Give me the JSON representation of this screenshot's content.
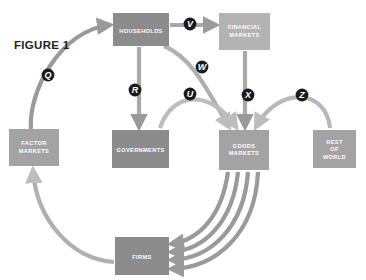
{
  "figure": {
    "title": "FIGURE 1",
    "background": "#ffffff"
  },
  "colors": {
    "box_dark": "#8c8c8c",
    "box_light": "#b3b3b3",
    "box_mid": "#a3a3a3",
    "flow_dark": "#9a9a9a",
    "flow_light": "#bdbdbd",
    "node_circle": "#1a1a1a",
    "title_text": "#231f20",
    "label_text": "#ffffff"
  },
  "boxes": {
    "households": {
      "label": "HOUSEHOLDS",
      "lines": [
        "HOUSEHOLDS"
      ],
      "x": 113,
      "y": 13,
      "w": 56,
      "h": 33,
      "fill": "#8c8c8c"
    },
    "financial_markets": {
      "label": "FINANCIAL MARKETS",
      "lines": [
        "FINANCIAL",
        "MARKETS"
      ],
      "x": 219,
      "y": 13,
      "w": 51,
      "h": 37,
      "fill": "#b3b3b3"
    },
    "factor_markets": {
      "label": "FACTOR MARKETS",
      "lines": [
        "FACTOR",
        "MARKETS"
      ],
      "x": 9,
      "y": 129,
      "w": 50,
      "h": 37,
      "fill": "#a3a3a3"
    },
    "governments": {
      "label": "GOVERNMENTS",
      "lines": [
        "GOVERNMENTS"
      ],
      "x": 112,
      "y": 130,
      "w": 57,
      "h": 38,
      "fill": "#8c8c8c"
    },
    "goods_markets": {
      "label": "GOODS MARKETS",
      "lines": [
        "GOODS",
        "MARKETS"
      ],
      "x": 219,
      "y": 130,
      "w": 50,
      "h": 40,
      "fill": "#a3a3a3"
    },
    "rest_of_world": {
      "label": "REST OF WORLD",
      "lines": [
        "REST",
        "OF",
        "WORLD"
      ],
      "x": 313,
      "y": 130,
      "w": 43,
      "h": 38,
      "fill": "#a3a3a3"
    },
    "firms": {
      "label": "FIRMS",
      "lines": [
        "FIRMS"
      ],
      "x": 115,
      "y": 237,
      "w": 54,
      "h": 38,
      "fill": "#8c8c8c"
    }
  },
  "flow_nodes": [
    {
      "letter": "Q",
      "x": 48,
      "y": 75
    },
    {
      "letter": "R",
      "x": 135,
      "y": 90
    },
    {
      "letter": "V",
      "x": 190,
      "y": 24
    },
    {
      "letter": "W",
      "x": 202,
      "y": 67
    },
    {
      "letter": "U",
      "x": 190,
      "y": 94
    },
    {
      "letter": "X",
      "x": 248,
      "y": 95
    },
    {
      "letter": "Z",
      "x": 302,
      "y": 95
    }
  ],
  "flows": [
    {
      "id": "flow-q",
      "letter": "Q",
      "from": "factor_markets",
      "to": "households"
    },
    {
      "id": "flow-r",
      "letter": "R",
      "from": "households",
      "to": "governments"
    },
    {
      "id": "flow-v",
      "letter": "V",
      "from": "households",
      "to": "financial_markets"
    },
    {
      "id": "flow-w",
      "letter": "W",
      "from": "households",
      "to": "goods_markets"
    },
    {
      "id": "flow-u",
      "letter": "U",
      "from": "governments",
      "to": "goods_markets"
    },
    {
      "id": "flow-x",
      "letter": "X",
      "from": "financial_markets",
      "to": "goods_markets"
    },
    {
      "id": "flow-z",
      "letter": "Z",
      "from": "rest_of_world",
      "to": "goods_markets"
    },
    {
      "id": "flow-firms-factor",
      "letter": "",
      "from": "firms",
      "to": "factor_markets"
    },
    {
      "id": "flow-goods-firms-1",
      "letter": "",
      "from": "goods_markets",
      "to": "firms"
    },
    {
      "id": "flow-goods-firms-2",
      "letter": "",
      "from": "goods_markets",
      "to": "firms"
    },
    {
      "id": "flow-goods-firms-3",
      "letter": "",
      "from": "goods_markets",
      "to": "firms"
    },
    {
      "id": "flow-goods-firms-4",
      "letter": "",
      "from": "goods_markets",
      "to": "firms"
    }
  ]
}
